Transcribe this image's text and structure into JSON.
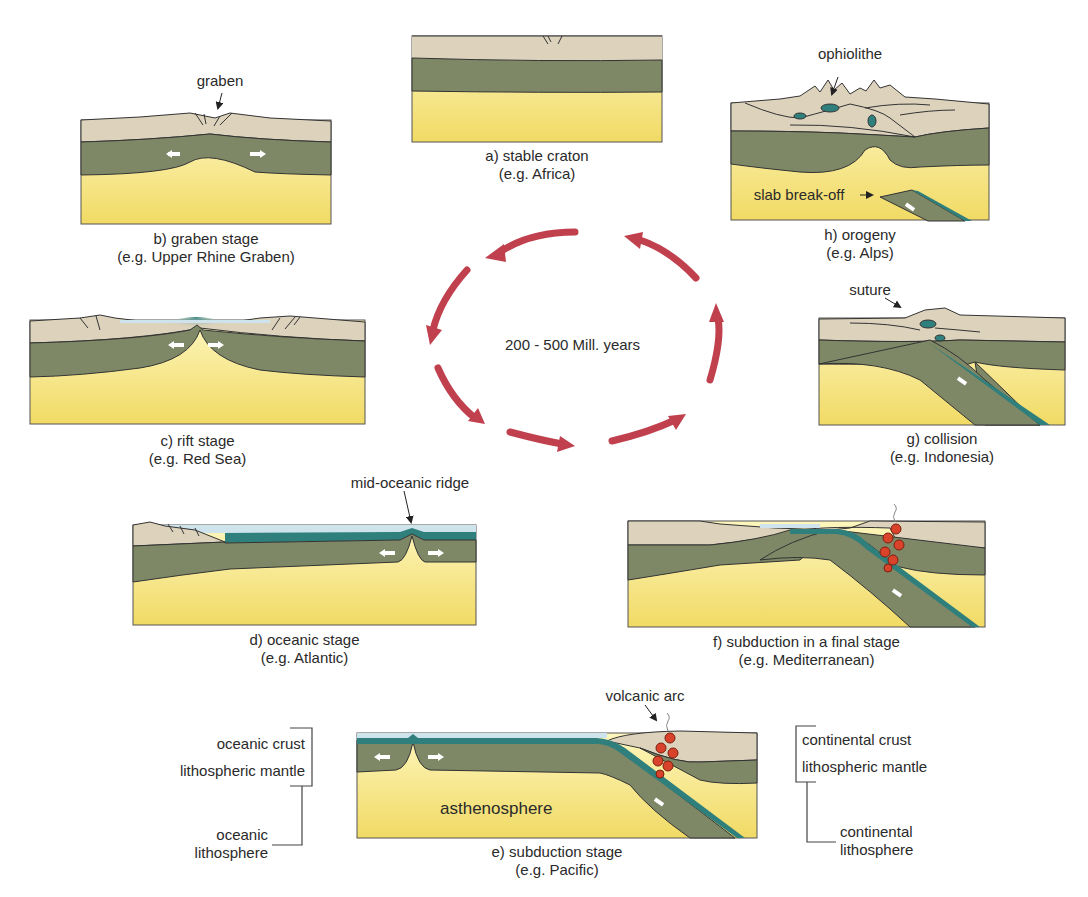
{
  "cycle_duration": "200 - 500 Mill. years",
  "colors": {
    "continental_crust": "#ddd3bd",
    "lithospheric_mantle": "#7e8866",
    "asthenosphere_top": "#fdf5b4",
    "asthenosphere_bottom": "#f2dc6a",
    "oceanic_crust": "#2f7f7c",
    "sea_water": "#cfe3ec",
    "cycle_arrow": "#c0404e",
    "magma": "#d9432b",
    "outline": "#3a3a32"
  },
  "stages": [
    {
      "id": "a",
      "caption": "a) stable craton",
      "example": "(e.g. Africa)",
      "annotations": []
    },
    {
      "id": "b",
      "caption": "b) graben stage",
      "example": "(e.g. Upper Rhine Graben)",
      "annotations": [
        "graben"
      ]
    },
    {
      "id": "c",
      "caption": "c) rift stage",
      "example": "(e.g. Red Sea)",
      "annotations": []
    },
    {
      "id": "d",
      "caption": "d) oceanic stage",
      "example": "(e.g. Atlantic)",
      "annotations": [
        "mid-oceanic ridge"
      ]
    },
    {
      "id": "e",
      "caption": "e) subduction stage",
      "example": "(e.g. Pacific)",
      "annotations": [
        "volcanic arc",
        "asthenosphere"
      ]
    },
    {
      "id": "f",
      "caption": "f) subduction in a final stage",
      "example": "(e.g. Mediterranean)",
      "annotations": []
    },
    {
      "id": "g",
      "caption": "g) collision",
      "example": "(e.g. Indonesia)",
      "annotations": [
        "suture"
      ]
    },
    {
      "id": "h",
      "caption": "h) orogeny",
      "example": "(e.g. Alps)",
      "annotations": [
        "ophiolithe",
        "slab break-off"
      ]
    }
  ],
  "legend": {
    "left": {
      "layers": [
        "oceanic crust",
        "lithospheric mantle"
      ],
      "group_line1": "oceanic",
      "group_line2": "lithosphere"
    },
    "right": {
      "layers": [
        "continental crust",
        "lithospheric mantle"
      ],
      "group_line1": "continental",
      "group_line2": "lithosphere"
    }
  }
}
